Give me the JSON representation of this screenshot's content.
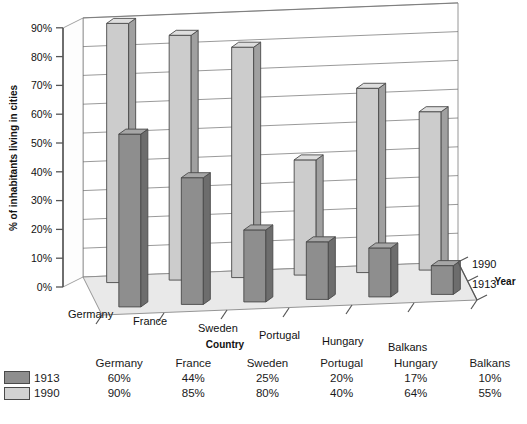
{
  "chart_data": {
    "type": "bar",
    "title": "",
    "subtitle": "",
    "xlabel": "Country",
    "ylabel": "% of inhabitants living in cities",
    "zlabel": "Year",
    "categories": [
      "Germany",
      "France",
      "Sweden",
      "Portugal",
      "Hungary",
      "Balkans"
    ],
    "series": [
      {
        "name": "1913",
        "values": [
          60,
          44,
          25,
          20,
          17,
          10
        ],
        "color": "#8e8e8e"
      },
      {
        "name": "1990",
        "values": [
          90,
          85,
          80,
          40,
          64,
          55
        ],
        "color": "#d2d2d2"
      }
    ],
    "value_labels": {
      "1913": [
        "60%",
        "44%",
        "25%",
        "20%",
        "17%",
        "10%"
      ],
      "1990": [
        "90%",
        "85%",
        "80%",
        "40%",
        "64%",
        "55%"
      ]
    },
    "ylim": [
      0,
      90
    ],
    "ytick_labels": [
      "0%",
      "10%",
      "20%",
      "30%",
      "40%",
      "50%",
      "60%",
      "70%",
      "80%",
      "90%"
    ],
    "ytick_values": [
      0,
      10,
      20,
      30,
      40,
      50,
      60,
      70,
      80,
      90
    ],
    "depth_labels": [
      "1913",
      "1990"
    ],
    "grid": true,
    "legend_position": "bottom-table",
    "three_d": true
  },
  "axes": {
    "y_title": "% of inhabitants living in cities",
    "x_title": "Country",
    "z_title": "Year"
  },
  "table": {
    "column_headers": [
      "",
      "",
      "Germany",
      "France",
      "Sweden",
      "Portugal",
      "Hungary",
      "Balkans"
    ],
    "rows": [
      {
        "swatch": "swatch-1913",
        "series": "1913",
        "values": [
          "60%",
          "44%",
          "25%",
          "20%",
          "17%",
          "10%"
        ]
      },
      {
        "swatch": "swatch-1990",
        "series": "1990",
        "values": [
          "90%",
          "85%",
          "80%",
          "40%",
          "64%",
          "55%"
        ]
      }
    ]
  },
  "colors": {
    "bar_1913_front": "#8e8e8e",
    "bar_1913_side": "#6d6d6d",
    "bar_1913_top": "#a6a6a6",
    "bar_1990_front": "#cccccc",
    "bar_1990_side": "#a0a0a0",
    "bar_1990_top": "#dedede",
    "floor": "#e9e9e9",
    "wall": "#ffffff",
    "outline": "#4a4a4a",
    "gridline": "#6f6f6f"
  }
}
